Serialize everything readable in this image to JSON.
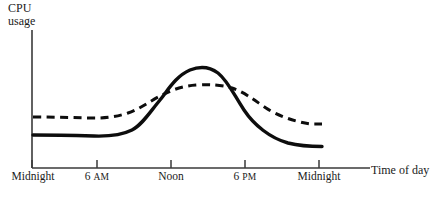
{
  "chart_data": {
    "type": "line",
    "title": "",
    "subtitle": "",
    "xlabel": "Time of day",
    "ylabel_line1": "CPU",
    "ylabel_line2": "usage",
    "grid": false,
    "legend_position": "none",
    "axis": {
      "x_tick_labels": [
        "Midnight",
        "6 AM",
        "Noon",
        "6 PM",
        "Midnight"
      ],
      "x_tick_values": [
        0,
        6,
        12,
        18,
        24
      ],
      "x_range": [
        0,
        24
      ],
      "y_range": [
        0,
        1
      ],
      "y_tick_labels": []
    },
    "x": [
      0,
      1.5,
      3,
      4.5,
      6,
      7.5,
      9,
      10.5,
      12,
      13.5,
      15,
      16.5,
      18,
      19.5,
      21,
      22.5,
      23.5
    ],
    "series": [
      {
        "name": "solid-curve",
        "style": "solid",
        "color": "#0d0d0d",
        "values": [
          0.33,
          0.33,
          0.32,
          0.32,
          0.33,
          0.36,
          0.45,
          0.62,
          0.78,
          0.8,
          0.73,
          0.58,
          0.45,
          0.36,
          0.31,
          0.29,
          0.28
        ]
      },
      {
        "name": "dashed-curve",
        "style": "dashed",
        "color": "#0d0d0d",
        "values": [
          0.49,
          0.49,
          0.48,
          0.48,
          0.49,
          0.52,
          0.58,
          0.63,
          0.65,
          0.65,
          0.64,
          0.6,
          0.55,
          0.5,
          0.46,
          0.44,
          0.43
        ]
      }
    ],
    "annotations": [],
    "crossings": [
      {
        "x": 11.1,
        "note": "curves cross as solid rises above dashed"
      },
      {
        "x": 16.4,
        "note": "curves cross as solid falls below dashed"
      }
    ]
  }
}
